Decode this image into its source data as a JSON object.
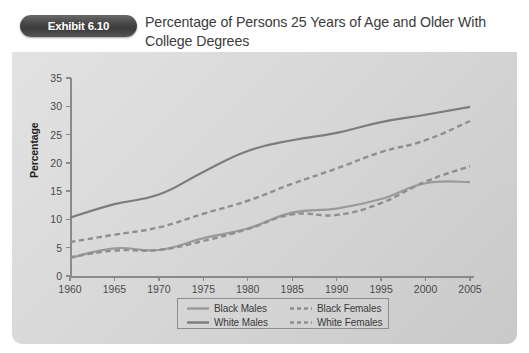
{
  "header": {
    "badge_label": "Exhibit 6.10",
    "title": "Percentage of Persons 25 Years of Age and Older With College Degrees"
  },
  "colors": {
    "panel_light": "#e2e2e2",
    "panel_dark": "#c9c9c9",
    "axis": "#8a8a8a",
    "black_males": "#9a9a9a",
    "white_males": "#7c7c7c",
    "black_females": "#8f8f8f",
    "white_females": "#8f8f8f",
    "badge": "#3a3a3a",
    "text": "#3b3b3b"
  },
  "chart_data": {
    "type": "line",
    "title": "Percentage of Persons 25 Years of Age and Older With College Degrees",
    "xlabel": "",
    "ylabel": "Percentage",
    "xlim": [
      1960,
      2005
    ],
    "ylim": [
      0,
      35
    ],
    "grid": false,
    "legend_position": "bottom-center",
    "x": [
      1960,
      1965,
      1970,
      1975,
      1980,
      1985,
      1990,
      1995,
      2000,
      2005
    ],
    "xticklabels": [
      "1960",
      "1965",
      "1970",
      "1975",
      "1980",
      "1985",
      "1990",
      "1995",
      "2000",
      "2005"
    ],
    "yticklabels": [
      "0",
      "5",
      "10",
      "15",
      "20",
      "25",
      "30",
      "35"
    ],
    "series": [
      {
        "name": "Black Males",
        "style": "solid",
        "color": "#9a9a9a",
        "values": [
          3.2,
          4.9,
          4.6,
          6.7,
          8.4,
          11.2,
          11.9,
          13.6,
          16.4,
          16.6
        ]
      },
      {
        "name": "White Males",
        "style": "solid",
        "color": "#7c7c7c",
        "values": [
          10.3,
          12.7,
          14.4,
          18.4,
          22.1,
          24.0,
          25.3,
          27.2,
          28.5,
          29.9
        ]
      },
      {
        "name": "Black Females",
        "style": "dashed",
        "color": "#8f8f8f",
        "values": [
          3.3,
          4.5,
          4.6,
          6.2,
          8.3,
          10.9,
          10.8,
          12.9,
          16.7,
          19.4
        ]
      },
      {
        "name": "White Females",
        "style": "dashed",
        "color": "#8f8f8f",
        "values": [
          6.0,
          7.3,
          8.6,
          11.0,
          13.3,
          16.3,
          19.0,
          21.9,
          24.0,
          27.4
        ]
      }
    ]
  },
  "legend": {
    "items": [
      {
        "label": "Black Males",
        "style": "solid"
      },
      {
        "label": "White Males",
        "style": "solid"
      },
      {
        "label": "Black Females",
        "style": "dashed"
      },
      {
        "label": "White Females",
        "style": "dashed"
      }
    ]
  }
}
